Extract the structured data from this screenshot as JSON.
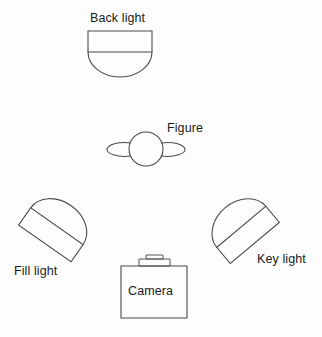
{
  "diagram": {
    "background_color": "#fdfdfd",
    "line_color": "#4a4a4a",
    "text_color": "#1a1a1a",
    "labels": {
      "back_light": "Back light",
      "figure": "Figure",
      "fill_light": "Fill light",
      "key_light": "Key light",
      "camera": "Camera"
    },
    "elements": [
      {
        "name": "back-light",
        "label": "Back light",
        "shape": "dome-lamp",
        "rotation_deg": 0,
        "center_x": 120,
        "center_y": 54
      },
      {
        "name": "figure",
        "label": "Figure",
        "shape": "circle-with-side-ellipses",
        "center_x": 146,
        "center_y": 149,
        "radius": 17
      },
      {
        "name": "fill-light",
        "label": "Fill light",
        "shape": "dome-lamp",
        "rotation_deg": 35,
        "center_x": 50,
        "center_y": 236
      },
      {
        "name": "key-light",
        "label": "Key light",
        "shape": "dome-lamp",
        "rotation_deg": -40,
        "center_x": 249,
        "center_y": 236
      },
      {
        "name": "camera",
        "label": "Camera",
        "shape": "box-with-viewfinder",
        "center_x": 154,
        "center_y": 292
      }
    ]
  }
}
